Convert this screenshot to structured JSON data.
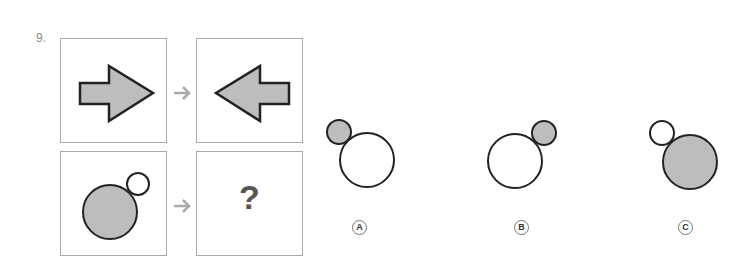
{
  "question": {
    "number": "9.",
    "missing": "?"
  },
  "options": [
    {
      "label": "A",
      "small": "gray, upper-left",
      "large": "white"
    },
    {
      "label": "B",
      "small": "gray, upper-right",
      "large": "white"
    },
    {
      "label": "C",
      "small": "white, upper-left",
      "large": "gray"
    }
  ],
  "colors": {
    "fill": "#bdbdbd",
    "stroke": "#222222",
    "arrow": "#aaaaaa"
  }
}
